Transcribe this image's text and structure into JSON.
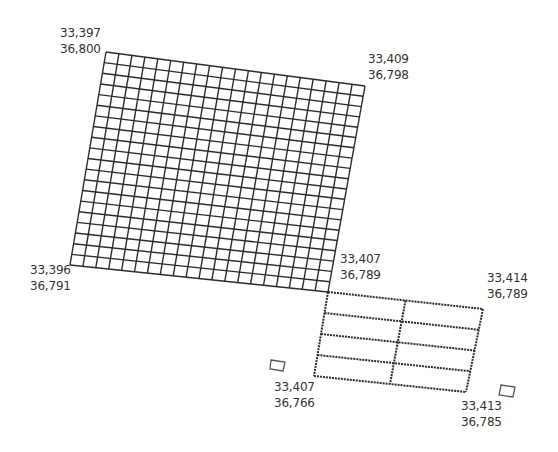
{
  "colors": {
    "background": "#ffffff",
    "grid_line": "#2b2b2b",
    "label_text": "#333333"
  },
  "large_grid": {
    "corners": {
      "tl": [
        106,
        52
      ],
      "tr": [
        365,
        86
      ],
      "br": [
        328,
        292
      ],
      "bl": [
        70,
        265
      ]
    },
    "columns": 20,
    "rows": 20
  },
  "small_grid": {
    "corners": {
      "tl": [
        328,
        292
      ],
      "tr": [
        483,
        309
      ],
      "br": [
        466,
        392
      ],
      "bl": [
        314,
        376
      ]
    },
    "columns": 2,
    "rows": 4
  },
  "markers": [
    {
      "name": "marker-square-left",
      "corners": [
        [
          271,
          360
        ],
        [
          285,
          362
        ],
        [
          283,
          371
        ],
        [
          270,
          369
        ]
      ]
    },
    {
      "name": "marker-square-right",
      "corners": [
        [
          501,
          385
        ],
        [
          515,
          387
        ],
        [
          513,
          397
        ],
        [
          499,
          395
        ]
      ]
    }
  ],
  "labels": [
    {
      "id": "large-top-left",
      "x": 60,
      "y": 25,
      "lat": "33,397",
      "lon": "36,800"
    },
    {
      "id": "large-top-right",
      "x": 368,
      "y": 51,
      "lat": "33,409",
      "lon": "36,798"
    },
    {
      "id": "large-bottom-left",
      "x": 30,
      "y": 262,
      "lat": "33,396",
      "lon": "36,791"
    },
    {
      "id": "junction",
      "x": 340,
      "y": 251,
      "lat": "33,407",
      "lon": "36,789"
    },
    {
      "id": "small-top-right",
      "x": 487,
      "y": 270,
      "lat": "33,414",
      "lon": "36,789"
    },
    {
      "id": "small-bottom-left",
      "x": 274,
      "y": 379,
      "lat": "33,407",
      "lon": "36,766"
    },
    {
      "id": "small-bottom-right",
      "x": 461,
      "y": 398,
      "lat": "33,413",
      "lon": "36,785"
    }
  ]
}
